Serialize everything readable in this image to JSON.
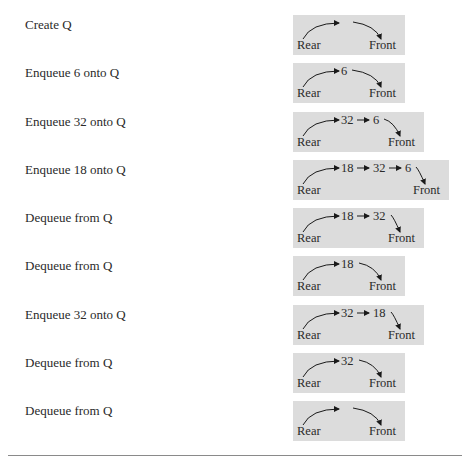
{
  "diagram": {
    "type": "queue-operations-trace",
    "rows": [
      {
        "operation": "Create Q",
        "queue": [],
        "rear_label": "Rear",
        "front_label": "Front"
      },
      {
        "operation": "Enqueue 6 onto Q",
        "queue": [
          "6"
        ],
        "rear_label": "Rear",
        "front_label": "Front"
      },
      {
        "operation": "Enqueue 32 onto Q",
        "queue": [
          "32",
          "6"
        ],
        "rear_label": "Rear",
        "front_label": "Front"
      },
      {
        "operation": "Enqueue 18 onto Q",
        "queue": [
          "18",
          "32",
          "6"
        ],
        "rear_label": "Rear",
        "front_label": "Front"
      },
      {
        "operation": "Dequeue from Q",
        "queue": [
          "18",
          "32"
        ],
        "rear_label": "Rear",
        "front_label": "Front"
      },
      {
        "operation": "Dequeue from Q",
        "queue": [
          "18"
        ],
        "rear_label": "Rear",
        "front_label": "Front"
      },
      {
        "operation": "Enqueue 32 onto Q",
        "queue": [
          "32",
          "18"
        ],
        "rear_label": "Rear",
        "front_label": "Front"
      },
      {
        "operation": "Dequeue from Q",
        "queue": [
          "32"
        ],
        "rear_label": "Rear",
        "front_label": "Front"
      },
      {
        "operation": "Dequeue from Q",
        "queue": [],
        "rear_label": "Rear",
        "front_label": "Front"
      }
    ]
  },
  "colors": {
    "box_fill": "#dcdcdc",
    "text": "#2a2a2a",
    "arrow": "#1a1a1a",
    "rule": "#8a8a8a"
  }
}
